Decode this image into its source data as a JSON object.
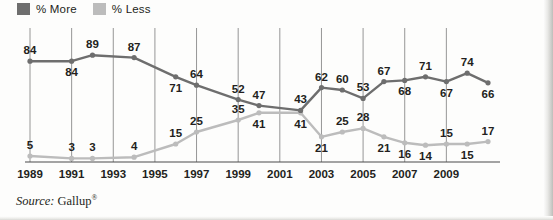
{
  "legend": {
    "items": [
      {
        "label": "% More",
        "color": "#6e6e6e",
        "name": "more"
      },
      {
        "label": "% Less",
        "color": "#bcbcbc",
        "name": "less"
      }
    ]
  },
  "source": {
    "label": "Source:",
    "value": "Gallup",
    "mark": "®"
  },
  "credit": {
    "text": "© 2013 Cengage Learning"
  },
  "chart_data": {
    "type": "line",
    "title": "",
    "subtitle": "",
    "xlabel": "",
    "ylabel": "",
    "grid": "vertical-at-labeled-years",
    "legend_position": "top-left",
    "ylim": [
      0,
      100
    ],
    "x": [
      1989,
      1990,
      1991,
      1992,
      1993,
      1994,
      1995,
      1996,
      1997,
      1998,
      1999,
      2000,
      2001,
      2002,
      2003,
      2004,
      2005,
      2006,
      2007,
      2008,
      2009,
      2010,
      2011
    ],
    "tick_labels": [
      "1989",
      "1991",
      "1993",
      "1995",
      "1997",
      "1999",
      "2001",
      "2003",
      "2005",
      "2007",
      "2009"
    ],
    "tick_values": [
      1989,
      1991,
      1993,
      1995,
      1997,
      1999,
      2001,
      2003,
      2005,
      2007,
      2009
    ],
    "series": [
      {
        "name": "% More",
        "color": "#6e6e6e",
        "x": [
          1989,
          1991,
          1992,
          1994,
          1996,
          1997,
          1999,
          2000,
          2002,
          2003,
          2004,
          2005,
          2006,
          2007,
          2008,
          2009,
          2010,
          2011
        ],
        "values": [
          84,
          84,
          89,
          87,
          71,
          64,
          52,
          47,
          43,
          62,
          60,
          53,
          67,
          68,
          71,
          67,
          74,
          66
        ],
        "labels": [
          "84",
          "84",
          "89",
          "87",
          "71",
          "64",
          "52",
          "47",
          "43",
          "62",
          "60",
          "53",
          "67",
          "68",
          "71",
          "67",
          "74",
          "66"
        ]
      },
      {
        "name": "% Less",
        "color": "#bcbcbc",
        "x": [
          1989,
          1991,
          1992,
          1994,
          1996,
          1997,
          1999,
          2000,
          2002,
          2003,
          2004,
          2005,
          2006,
          2007,
          2008,
          2009,
          2010,
          2011
        ],
        "values": [
          5,
          3,
          3,
          4,
          15,
          25,
          35,
          41,
          41,
          21,
          25,
          28,
          21,
          16,
          14,
          15,
          15,
          17
        ],
        "labels": [
          "5",
          "3",
          "3",
          "4",
          "15",
          "25",
          "35",
          "41",
          "41",
          "21",
          "25",
          "28",
          "21",
          "16",
          "14",
          "15",
          "15",
          "17"
        ]
      }
    ]
  }
}
